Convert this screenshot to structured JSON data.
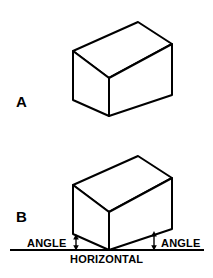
{
  "figure": {
    "background_color": "#ffffff",
    "stroke_color": "#000000",
    "fill_color": "#ffffff",
    "width": 213,
    "height": 278
  },
  "panels": [
    {
      "key": "a",
      "label": "A",
      "description": "isometric rectangular box drawn level",
      "box": {
        "top_left": [
          73,
          51
        ],
        "top_apex": [
          138,
          22
        ],
        "top_right": [
          172,
          44
        ],
        "front_top": [
          109,
          78
        ],
        "bottom_left": [
          73,
          100
        ],
        "bottom_front": [
          109,
          116
        ],
        "bottom_right": [
          172,
          95
        ]
      }
    },
    {
      "key": "b",
      "label": "B",
      "description": "isometric rectangular box resting on a horizontal reference line with angle callouts",
      "box": {
        "top_left": [
          73,
          185
        ],
        "top_apex": [
          138,
          156
        ],
        "top_right": [
          172,
          178
        ],
        "front_top": [
          109,
          212
        ],
        "bottom_left": [
          73,
          234
        ],
        "bottom_front": [
          109,
          250
        ],
        "bottom_right": [
          172,
          229
        ]
      }
    }
  ],
  "annotations": {
    "angle_left_label": "ANGLE",
    "angle_right_label": "ANGLE",
    "horizontal_label": "HORIZONTAL",
    "horizontal_line": {
      "x1": 10,
      "x2": 204,
      "y": 250
    },
    "angle_arrow_left": {
      "x": 76,
      "y_top": 234,
      "y_bottom": 250
    },
    "angle_arrow_right": {
      "x": 154,
      "y_top": 231,
      "y_bottom": 250
    }
  }
}
